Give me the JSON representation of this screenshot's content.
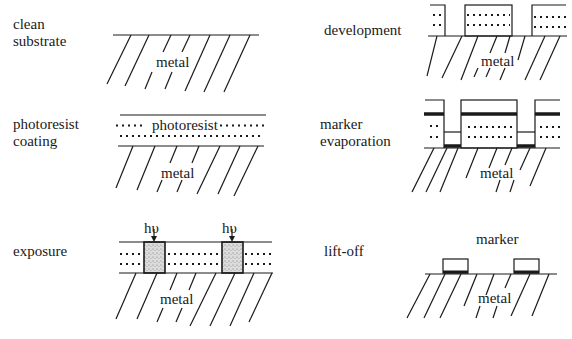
{
  "diagram": {
    "type": "process-flow",
    "steps": [
      {
        "id": "clean-substrate",
        "label": "clean\nsubstrate",
        "layers": [
          "metal"
        ]
      },
      {
        "id": "photoresist-coating",
        "label": "photoresist\ncoating",
        "layers": [
          "photoresist",
          "metal"
        ]
      },
      {
        "id": "exposure",
        "label": "exposure",
        "annotations": [
          "hυ",
          "hυ"
        ],
        "layers": [
          "photoresist",
          "metal"
        ]
      },
      {
        "id": "development",
        "label": "development",
        "layers": [
          "photoresist",
          "metal"
        ]
      },
      {
        "id": "marker-evaporation",
        "label": "marker\nevaporation",
        "layers": [
          "marker",
          "photoresist",
          "metal"
        ]
      },
      {
        "id": "lift-off",
        "label": "lift-off",
        "annotations": [
          "marker"
        ],
        "layers": [
          "marker",
          "metal"
        ]
      }
    ]
  },
  "labels": {
    "clean_substrate": "clean\nsubstrate",
    "photoresist_coating": "photoresist\ncoating",
    "exposure": "exposure",
    "development": "development",
    "marker_evaporation": "marker\nevaporation",
    "lift_off": "lift-off"
  },
  "layer_text": {
    "metal": "metal",
    "photoresist": "photoresist",
    "marker": "marker",
    "light": "hυ"
  },
  "colors": {
    "line": "#1a1a1a",
    "background": "#ffffff",
    "exposed_fill": "#d4d4d4"
  }
}
